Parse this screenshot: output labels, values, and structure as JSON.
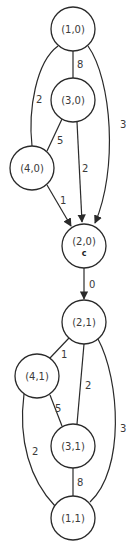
{
  "diagram": {
    "type": "graph",
    "components": [
      {
        "name": "layer-0",
        "nodes": [
          {
            "id": "n10",
            "label": "(1,0)",
            "cx": 73,
            "cy": 29
          },
          {
            "id": "n30",
            "label": "(3,0)",
            "cx": 73,
            "cy": 100
          },
          {
            "id": "n40",
            "label": "(4,0)",
            "cx": 32,
            "cy": 168
          },
          {
            "id": "n20",
            "label": "(2,0)",
            "sublabel": "c",
            "cx": 84,
            "cy": 246
          }
        ]
      },
      {
        "name": "layer-1",
        "nodes": [
          {
            "id": "n21",
            "label": "(2,1)",
            "cx": 84,
            "cy": 322
          },
          {
            "id": "n41",
            "label": "(4,1)",
            "cx": 37,
            "cy": 376
          },
          {
            "id": "n31",
            "label": "(3,1)",
            "cx": 73,
            "cy": 446
          },
          {
            "id": "n11",
            "label": "(1,1)",
            "cx": 73,
            "cy": 518
          }
        ]
      }
    ],
    "edges": [
      {
        "from": "(1,0)",
        "to": "(3,0)",
        "weight": "8",
        "directed": false
      },
      {
        "from": "(1,0)",
        "to": "(4,0)",
        "weight": "2",
        "directed": false
      },
      {
        "from": "(1,0)",
        "to": "(2,0)",
        "weight": "3",
        "directed": true
      },
      {
        "from": "(3,0)",
        "to": "(4,0)",
        "weight": "5",
        "directed": false
      },
      {
        "from": "(3,0)",
        "to": "(2,0)",
        "weight": "2",
        "directed": true
      },
      {
        "from": "(4,0)",
        "to": "(2,0)",
        "weight": "1",
        "directed": true
      },
      {
        "from": "(2,0)",
        "to": "(2,1)",
        "weight": "0",
        "directed": true
      },
      {
        "from": "(2,1)",
        "to": "(4,1)",
        "weight": "1",
        "directed": false
      },
      {
        "from": "(2,1)",
        "to": "(3,1)",
        "weight": "2",
        "directed": false
      },
      {
        "from": "(2,1)",
        "to": "(1,1)",
        "weight": "3",
        "directed": false
      },
      {
        "from": "(4,1)",
        "to": "(3,1)",
        "weight": "5",
        "directed": false
      },
      {
        "from": "(4,1)",
        "to": "(1,1)",
        "weight": "2",
        "directed": false
      },
      {
        "from": "(3,1)",
        "to": "(1,1)",
        "weight": "8",
        "directed": false
      }
    ],
    "colors": {
      "stroke": "#2a2a2a",
      "text": "#3a3a3a",
      "background": "#ffffff"
    }
  }
}
